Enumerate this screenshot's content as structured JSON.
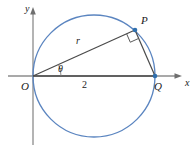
{
  "figure": {
    "width": 194,
    "height": 148,
    "background_color": "#ffffff"
  },
  "colors": {
    "circle_stroke": "#5b85c0",
    "point_fill": "#2f6fae",
    "segment_stroke": "#4a4a4a",
    "axis_stroke": "#8c8c8c",
    "label_color": "#1a1a1a",
    "right_angle_stroke": "#5a5a5a"
  },
  "axes": {
    "x_label": "x",
    "y_label": "y",
    "origin_label": "O",
    "x_axis": {
      "y": 76,
      "x_start": 8,
      "x_end": 180
    },
    "y_axis": {
      "x": 33,
      "y_start": 10,
      "y_end": 145
    }
  },
  "circle": {
    "center_x": 94,
    "center_y": 76,
    "radius": 61
  },
  "points": [
    {
      "name": "O",
      "label": "O",
      "x": 33,
      "y": 76,
      "label_x": 21,
      "label_y": 81,
      "show_dot": false
    },
    {
      "name": "P",
      "label": "P",
      "x": 135,
      "y": 30,
      "label_x": 141,
      "label_y": 15,
      "show_dot": true
    },
    {
      "name": "Q",
      "label": "Q",
      "x": 155,
      "y": 76,
      "label_x": 154,
      "label_y": 81,
      "show_dot": true
    }
  ],
  "segments": [
    {
      "name": "OP",
      "from": "O",
      "to": "P",
      "label": "r",
      "label_x": 76,
      "label_y": 36
    },
    {
      "name": "OQ",
      "from": "O",
      "to": "Q",
      "label": "2",
      "label_x": 82,
      "label_y": 80
    },
    {
      "name": "PQ",
      "from": "P",
      "to": "Q",
      "label": "",
      "label_x": 0,
      "label_y": 0
    }
  ],
  "angles": [
    {
      "name": "theta",
      "label": "θ",
      "at": "O",
      "label_x": 58,
      "label_y": 64
    },
    {
      "name": "right-angle",
      "label": "",
      "at": "P"
    }
  ],
  "chart_data": {
    "type": "diagram",
    "labels": [
      "x",
      "y",
      "O",
      "P",
      "Q",
      "r",
      "2",
      "θ"
    ],
    "annotations": [
      {
        "text": "r",
        "meaning": "length of segment OP"
      },
      {
        "text": "2",
        "meaning": "length of diameter OQ"
      },
      {
        "text": "θ",
        "meaning": "angle between OQ and OP at the origin"
      }
    ],
    "geometry": {
      "circle_center": [
        94,
        76
      ],
      "circle_radius": 61,
      "O": [
        33,
        76
      ],
      "P": [
        135,
        30
      ],
      "Q": [
        155,
        76
      ]
    }
  }
}
